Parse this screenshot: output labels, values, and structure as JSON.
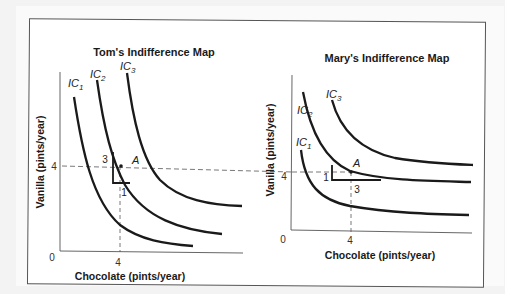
{
  "figure": {
    "panels": [
      {
        "id": "tom",
        "title": "Tom's Indifference Map",
        "xlabel": "Chocolate (pints/year)",
        "ylabel": "Vanilla (pints/year)",
        "origin_label": "0",
        "x_tick": "4",
        "y_tick": "4",
        "point_label": "A",
        "triangle_labels": {
          "vertical": "3",
          "horizontal": "1"
        },
        "curves": [
          {
            "name": "IC",
            "sub": "1"
          },
          {
            "name": "IC",
            "sub": "2"
          },
          {
            "name": "IC",
            "sub": "3"
          }
        ]
      },
      {
        "id": "mary",
        "title": "Mary's Indifference Map",
        "xlabel": "Chocolate (pints/year)",
        "ylabel": "Vanilla (pints/year)",
        "origin_label": "0",
        "x_tick": "4",
        "y_tick": "4",
        "point_label": "A",
        "triangle_labels": {
          "vertical": "1",
          "horizontal": "3"
        },
        "curves": [
          {
            "name": "IC",
            "sub": "1"
          },
          {
            "name": "IC",
            "sub": "2"
          },
          {
            "name": "IC",
            "sub": "3"
          }
        ]
      }
    ],
    "colors": {
      "curve": "#1a1a1a",
      "axis": "#555555",
      "dashed": "#555555",
      "background": "#f3f3f3",
      "frame": "#ffffff"
    }
  }
}
